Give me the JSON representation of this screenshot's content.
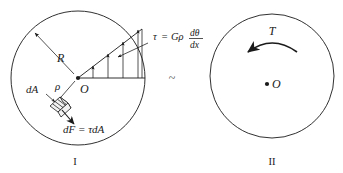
{
  "figure": {
    "title_visible": false,
    "background_color": "#ffffff",
    "line_color": "#1a1a1a",
    "relation_symbol": "~",
    "panels": [
      {
        "id": "panel-1",
        "caption": "I",
        "center_label": "O",
        "radius_label": "R",
        "rho_label": "ρ",
        "area_label": "dA",
        "force_label": "dF = τdA",
        "stress_formula": {
          "lhs": "τ",
          "equals": "=",
          "coefficient": "Gρ",
          "numerator": "dθ",
          "denominator": "dx"
        }
      },
      {
        "id": "panel-2",
        "caption": "II",
        "center_label": "O",
        "torque_label": "T",
        "torque_direction": "counterclockwise"
      }
    ]
  }
}
